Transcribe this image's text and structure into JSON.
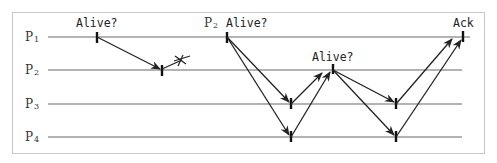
{
  "diagram": {
    "type": "message-sequence",
    "processes": [
      {
        "id": "P1",
        "letter": "P",
        "sub": "1",
        "y": 37
      },
      {
        "id": "P2",
        "letter": "P",
        "sub": "2",
        "y": 70
      },
      {
        "id": "P3",
        "letter": "P",
        "sub": "3",
        "y": 104
      },
      {
        "id": "P4",
        "letter": "P",
        "sub": "4",
        "y": 137
      }
    ],
    "labels": {
      "first_probe": "Alive?",
      "second_probe_sender": {
        "letter": "P",
        "sub": "2"
      },
      "second_probe": "Alive?",
      "relay_probe": "Alive?",
      "ack": "Ack"
    },
    "messages": [
      {
        "from": "P1",
        "to": "P2",
        "note": "Alive? sent by P1, received by P2"
      },
      {
        "from": "P2",
        "to": "lost",
        "note": "reply lost (X)"
      },
      {
        "from": "P1",
        "to": "P3",
        "note": "P2 Alive?"
      },
      {
        "from": "P1",
        "to": "P4",
        "note": "P2 Alive?"
      },
      {
        "from": "P3",
        "to": "P2"
      },
      {
        "from": "P4",
        "to": "P2"
      },
      {
        "from": "P2",
        "to": "P3",
        "note": "Alive?"
      },
      {
        "from": "P2",
        "to": "P4",
        "note": "Alive?"
      },
      {
        "from": "P3",
        "to": "P1",
        "note": "Ack"
      },
      {
        "from": "P4",
        "to": "P1",
        "note": "Ack"
      }
    ],
    "colors": {
      "timeline": "#9a9a9a",
      "arrow": "#222222",
      "frame": "#c8c8c8"
    }
  }
}
